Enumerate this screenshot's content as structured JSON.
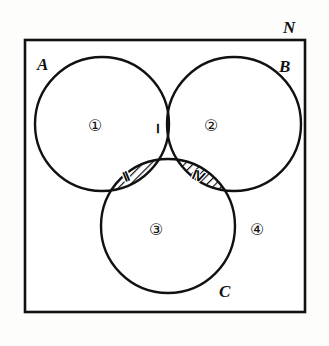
{
  "figure": {
    "kind": "venn-diagram",
    "universe_label": "N",
    "sets": [
      {
        "id": "A",
        "label": "A"
      },
      {
        "id": "B",
        "label": "B"
      },
      {
        "id": "C",
        "label": "C"
      }
    ],
    "regions": [
      {
        "id": "A-only",
        "label": "①",
        "shaded": false
      },
      {
        "id": "B-only",
        "label": "②",
        "shaded": false
      },
      {
        "id": "C-only",
        "label": "③",
        "shaded": false
      },
      {
        "id": "outside",
        "label": "④",
        "shaded": false
      },
      {
        "id": "A-and-B",
        "label": "Ⅰ",
        "shaded": true
      },
      {
        "id": "A-and-C",
        "label": "Ⅱ",
        "shaded": true
      },
      {
        "id": "B-and-C",
        "label": "Ⅳ",
        "shaded": true
      }
    ],
    "colors": {
      "stroke": "#111111",
      "fill": "#ffffff",
      "hatch": "#111111",
      "background": "#fdfdfb"
    },
    "geometry": {
      "rect": {
        "x": 25,
        "y": 40,
        "w": 280,
        "h": 272
      },
      "circle_radius": 67,
      "circle_a": {
        "cx": 102,
        "cy": 124
      },
      "circle_b": {
        "cx": 234,
        "cy": 124
      },
      "circle_c": {
        "cx": 168,
        "cy": 226
      }
    }
  }
}
